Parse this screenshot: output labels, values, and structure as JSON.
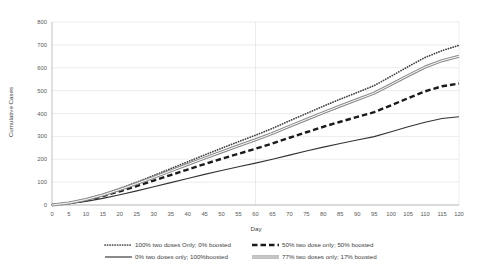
{
  "chart_data": {
    "type": "line",
    "title": "",
    "xlabel": "Day",
    "ylabel": "Cumulative Cases",
    "xlim": [
      0,
      120
    ],
    "ylim": [
      0,
      800
    ],
    "xticks": [
      0,
      5,
      10,
      15,
      20,
      25,
      30,
      35,
      40,
      45,
      50,
      55,
      60,
      65,
      70,
      75,
      80,
      85,
      90,
      95,
      100,
      105,
      110,
      115,
      120
    ],
    "yticks": [
      0,
      100,
      200,
      300,
      400,
      500,
      600,
      700,
      800
    ],
    "grid": "horizontal-and-major-vertical",
    "legend_position": "bottom",
    "x": [
      0,
      5,
      10,
      15,
      20,
      25,
      30,
      35,
      40,
      45,
      50,
      55,
      60,
      65,
      70,
      75,
      80,
      85,
      90,
      95,
      100,
      105,
      110,
      115,
      120
    ],
    "series": [
      {
        "name": "100% two doses Only; 0% boosted",
        "style": "dotted",
        "color": "#404040",
        "values": [
          0,
          10,
          26,
          47,
          72,
          100,
          129,
          159,
          189,
          219,
          248,
          277,
          305,
          335,
          368,
          400,
          432,
          463,
          492,
          522,
          563,
          605,
          645,
          675,
          698
        ]
      },
      {
        "name": "50% two dose only; 50% boosted",
        "style": "dashed",
        "color": "#1a1a1a",
        "values": [
          0,
          8,
          21,
          39,
          60,
          83,
          107,
          131,
          155,
          179,
          202,
          224,
          246,
          269,
          294,
          318,
          342,
          364,
          385,
          406,
          436,
          467,
          497,
          519,
          531
        ]
      },
      {
        "name": "0% two doses only; 100%boosted",
        "style": "solid-thin",
        "color": "#333333",
        "values": [
          0,
          6,
          16,
          29,
          45,
          62,
          80,
          98,
          116,
          134,
          151,
          167,
          183,
          200,
          218,
          236,
          253,
          269,
          284,
          299,
          320,
          342,
          362,
          378,
          386
        ]
      },
      {
        "name": "77% two doses only; 17% boosted",
        "style": "double",
        "color": "#808080",
        "values": [
          0,
          9,
          24,
          44,
          68,
          94,
          121,
          149,
          177,
          205,
          232,
          259,
          285,
          313,
          344,
          374,
          404,
          433,
          461,
          489,
          527,
          566,
          603,
          631,
          650
        ]
      }
    ]
  },
  "legend": {
    "entries": [
      {
        "label": "100% two doses Only; 0% boosted",
        "marker": "dotted"
      },
      {
        "label": "50% two dose only; 50% boosted",
        "marker": "dashed"
      },
      {
        "label": "0% two doses only; 100%boosted",
        "marker": "solid-thin"
      },
      {
        "label": "77% two doses only; 17% boosted",
        "marker": "double"
      }
    ]
  }
}
